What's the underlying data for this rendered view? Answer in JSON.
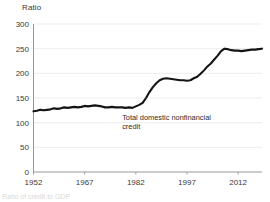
{
  "chart_data": {
    "type": "line",
    "title": "",
    "subtitle": "",
    "ylabel": "Ratio",
    "xlabel": "",
    "ylim": [
      0,
      300
    ],
    "xlim": [
      1952,
      2019
    ],
    "grid": true,
    "legend_position": "none",
    "yticks": [
      0,
      50,
      100,
      150,
      200,
      250,
      300
    ],
    "ytick_labels": [
      "0",
      "50",
      "100",
      "150",
      "200",
      "250",
      "300"
    ],
    "xticks": [
      1952,
      1967,
      1982,
      1997,
      2012
    ],
    "xtick_labels": [
      "1952",
      "1967",
      "1982",
      "1997",
      "2012"
    ],
    "annotations": [
      {
        "name": "series-annotation",
        "lines": [
          "Total domestic nonfinancial",
          "credit"
        ],
        "x": 1978,
        "y": 105
      }
    ],
    "series": [
      {
        "name": "Total domestic nonfinancial credit",
        "color": "#141414",
        "x": [
          1952,
          1953,
          1954,
          1955,
          1956,
          1957,
          1958,
          1959,
          1960,
          1961,
          1962,
          1963,
          1964,
          1965,
          1966,
          1967,
          1968,
          1969,
          1970,
          1971,
          1972,
          1973,
          1974,
          1975,
          1976,
          1977,
          1978,
          1979,
          1980,
          1981,
          1982,
          1983,
          1984,
          1985,
          1986,
          1987,
          1988,
          1989,
          1990,
          1991,
          1992,
          1993,
          1994,
          1995,
          1996,
          1997,
          1998,
          1999,
          2000,
          2001,
          2002,
          2003,
          2004,
          2005,
          2006,
          2007,
          2008,
          2009,
          2010,
          2011,
          2012,
          2013,
          2014,
          2015,
          2016,
          2017,
          2018,
          2019
        ],
        "values": [
          123,
          124,
          126,
          125,
          126,
          127,
          129,
          128,
          129,
          131,
          130,
          131,
          132,
          131,
          132,
          134,
          133,
          134,
          135,
          134,
          133,
          131,
          131,
          132,
          131,
          131,
          131,
          130,
          131,
          130,
          133,
          136,
          140,
          150,
          162,
          172,
          180,
          186,
          189,
          190,
          189,
          188,
          187,
          186,
          186,
          185,
          186,
          190,
          193,
          199,
          206,
          214,
          220,
          228,
          236,
          245,
          250,
          249,
          247,
          246,
          246,
          245,
          246,
          247,
          248,
          248,
          249,
          250
        ]
      }
    ]
  },
  "footnote": {
    "text": "Ratio of credit to GDP"
  }
}
